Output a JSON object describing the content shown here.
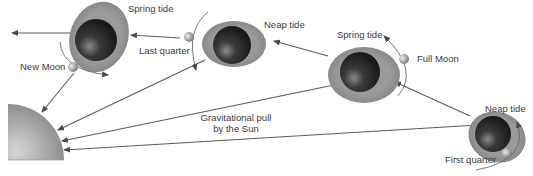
{
  "diagram": {
    "sun": {
      "label": "Sun",
      "color": "#8c8c8c"
    },
    "gravity_label_line1": "Gravitational pull",
    "gravity_label_line2": "by the Sun",
    "positions": [
      {
        "id": "new-moon",
        "moon_label": "New Moon",
        "tide_label": "Spring tide"
      },
      {
        "id": "last-quarter",
        "moon_label": "Last quarter",
        "tide_label": "Neap tide"
      },
      {
        "id": "full-moon",
        "moon_label": "Full Moon",
        "tide_label": "Spring tide"
      },
      {
        "id": "first-quarter",
        "moon_label": "First quarter",
        "tide_label": "Neap tide"
      }
    ],
    "colors": {
      "tidal_bulge": "#8e8e8e",
      "earth_dark": "#1e1e1e",
      "arrow": "#5a5a5a",
      "text": "#3a3a3a"
    }
  }
}
